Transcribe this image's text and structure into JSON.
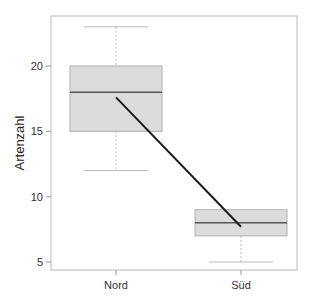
{
  "chart_data": {
    "type": "boxplot",
    "title": "",
    "xlabel": "",
    "ylabel": "Artenzahl",
    "categories": [
      "Nord",
      "Süd"
    ],
    "boxes": [
      {
        "name": "Nord",
        "whisker_low": 12,
        "q1": 15,
        "median": 18,
        "q3": 20,
        "whisker_high": 23,
        "mean": 17.6
      },
      {
        "name": "Süd",
        "whisker_low": 5,
        "q1": 7,
        "median": 8,
        "q3": 9,
        "whisker_high": 9,
        "mean": 7.7
      }
    ],
    "overlay_line": {
      "description": "line connecting group means",
      "points": [
        17.6,
        7.7
      ]
    },
    "yticks": [
      5,
      10,
      15,
      20
    ],
    "ylim": [
      4.4,
      24.1
    ],
    "grid": false,
    "legend": null
  },
  "colors": {
    "box_fill": "#dcdcdc",
    "box_border": "#b0b0b0",
    "median": "#555555",
    "mean_line": "#1a1a1a",
    "whisker": "#bbbbbb",
    "frame": "#b8b8b8"
  }
}
